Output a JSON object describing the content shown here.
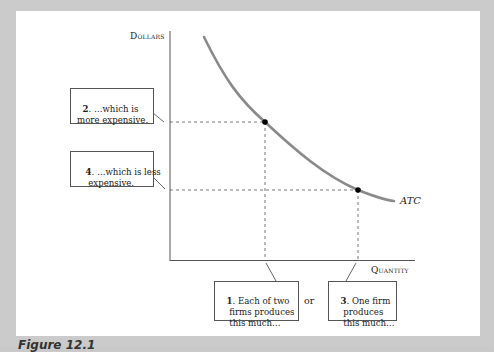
{
  "figure": {
    "caption": "Figure 12.1",
    "y_axis_label": "Dollars",
    "x_axis_label": "Quantity",
    "curve_label": "ATC",
    "or_label": "or",
    "colors": {
      "curve": "#8a8a8a",
      "axis": "#555555",
      "dashed": "#555555",
      "point": "#000000",
      "frame": "#cbcbcb",
      "panel": "#ffffff"
    },
    "callouts": [
      {
        "id": "callout-2",
        "number": "2",
        "text": ". …which is\nmore expensive."
      },
      {
        "id": "callout-4",
        "number": "4",
        "text": ". …which is less\n   expensive."
      },
      {
        "id": "callout-1",
        "number": "1",
        "text": ". Each of two\n   firms produces\n   this much…"
      },
      {
        "id": "callout-3",
        "number": "3",
        "text": ". One firm\n   produces\n   this much…"
      }
    ],
    "points": [
      {
        "name": "two-firms-point",
        "x": 265,
        "y": 122
      },
      {
        "name": "one-firm-point",
        "x": 358,
        "y": 190
      }
    ]
  }
}
